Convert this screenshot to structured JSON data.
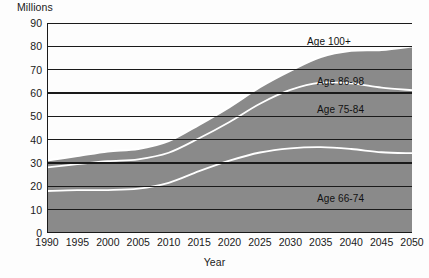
{
  "chart_data": {
    "type": "area",
    "stacked": true,
    "title": "",
    "xlabel": "Year",
    "ylabel": "Millions",
    "grid": true,
    "legend_position": "inline-band-labels",
    "xlim": [
      1990,
      2050
    ],
    "ylim": [
      0,
      90
    ],
    "ytick_step": 10,
    "x": [
      1990,
      1995,
      2000,
      2005,
      2010,
      2015,
      2020,
      2025,
      2030,
      2035,
      2040,
      2045,
      2050
    ],
    "yticks": [
      "0",
      "10",
      "20",
      "30",
      "40",
      "50",
      "60",
      "70",
      "80",
      "90"
    ],
    "xticks": [
      "1990",
      "1995",
      "2000",
      "2005",
      "2010",
      "2015",
      "2020",
      "2025",
      "2030",
      "2035",
      "2040",
      "2045",
      "2050"
    ],
    "series": [
      {
        "name": "Age 66-74",
        "values": [
          18.0,
          18.4,
          18.4,
          19.0,
          21.5,
          26.5,
          31.0,
          34.5,
          36.3,
          36.8,
          36.0,
          34.6,
          34.2
        ]
      },
      {
        "name": "Age 75-84",
        "values": [
          10.1,
          11.1,
          12.4,
          12.6,
          12.9,
          14.1,
          16.6,
          20.9,
          25.0,
          27.6,
          28.1,
          27.7,
          27.0
        ]
      },
      {
        "name": "Age 86-98",
        "values": [
          3.0,
          3.5,
          4.2,
          4.4,
          5.0,
          5.8,
          6.4,
          7.1,
          8.2,
          11.0,
          14.0,
          16.2,
          18.8
        ]
      }
    ],
    "cumulative_totals": [
      31.1,
      33.0,
      35.0,
      36.0,
      39.4,
      46.4,
      54.0,
      62.5,
      69.5,
      75.4,
      78.1,
      78.5,
      80.0
    ],
    "annotations": [
      {
        "text": "Age 100+",
        "x_px": 307,
        "y_px": 36
      },
      {
        "text": "Age 86-98",
        "x_px": 317,
        "y_px": 76
      },
      {
        "text": "Age 75-84",
        "x_px": 317,
        "y_px": 104
      },
      {
        "text": "Age 66-74",
        "x_px": 317,
        "y_px": 193
      }
    ],
    "colors": {
      "band_age_66_74": "#8a8a8a",
      "band_age_75_84": "#8a8a8a",
      "band_age_86_98": "#8a8a8a",
      "separator_line": "#ffffff",
      "gridline": "#1a1a1a",
      "background": "#fdfdfd",
      "text": "#1a1a1a"
    }
  }
}
